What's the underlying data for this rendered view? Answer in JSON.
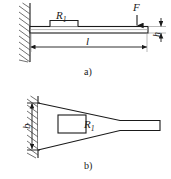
{
  "figure": {
    "type": "engineering-diagram",
    "stroke_color": "#1a1a1a",
    "background_color": "#ffffff",
    "hatch_color": "#4d4d4d"
  },
  "panel_a": {
    "caption": "a)",
    "labels": {
      "gauge": "R",
      "gauge_sub": "1",
      "force": "F",
      "length": "l",
      "thickness": "h"
    },
    "geometry": {
      "wall_x": 30,
      "beam_left": 30,
      "beam_right": 148,
      "beam_top": 26,
      "beam_bottom": 33,
      "gauge_x": 50,
      "gauge_width": 28,
      "gauge_height": 6,
      "force_x": 137,
      "dim_line_y": 47
    }
  },
  "panel_b": {
    "caption": "b)",
    "labels": {
      "gauge": "R",
      "gauge_sub": "1",
      "width": "b"
    },
    "geometry": {
      "wall_x": 38,
      "root_top": 103,
      "root_bottom": 150,
      "taper_tip_x": 120,
      "stub_right": 160,
      "stub_top": 120,
      "stub_bottom": 130,
      "gauge_x": 58,
      "gauge_y": 115,
      "gauge_width": 28,
      "gauge_height": 18,
      "dim_line_x": 27
    }
  }
}
